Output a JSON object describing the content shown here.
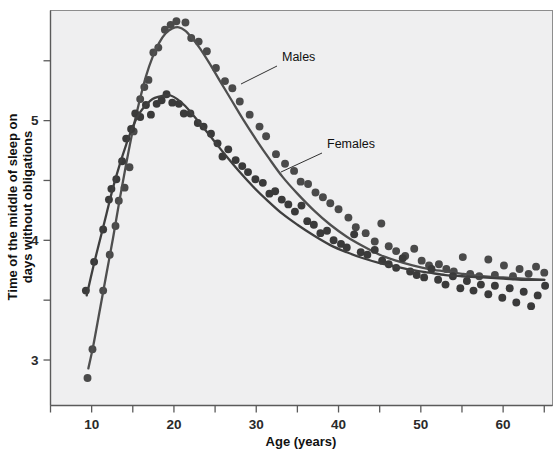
{
  "figure": {
    "background_color": "#ffffff",
    "plot_background_color": "#efeff0",
    "frame_color": "#8d8d8d"
  },
  "chart_data": {
    "type": "scatter",
    "title": "",
    "subtitle": "",
    "xlabel": "Age (years)",
    "ylabel": "Time of the middle of sleep on days without obligations",
    "ylabel_line1": "Time of the middle of sleep on",
    "ylabel_line2": "days without obligations",
    "xlim": [
      5,
      66
    ],
    "ylim": [
      2.62,
      5.92
    ],
    "grid": false,
    "legend_position": "inline-annotations",
    "x_major_ticks": [
      10,
      20,
      30,
      40,
      50,
      60
    ],
    "x_major_tick_labels": [
      "10",
      "20",
      "30",
      "40",
      "50",
      "60"
    ],
    "x_minor_ticks": [
      5,
      15,
      25,
      35,
      45,
      55,
      65
    ],
    "y_major_ticks": [
      3,
      4,
      5
    ],
    "y_major_tick_labels": [
      "3",
      "4",
      "5"
    ],
    "y_minor_ticks": [
      3.5,
      4.5,
      5.5
    ],
    "annotations": [
      {
        "text": "Males",
        "x_px": 282,
        "y_px": 61,
        "leader_from_px": [
          277,
          66
        ],
        "leader_to_px": [
          241,
          84
        ]
      },
      {
        "text": "Females",
        "x_px": 327,
        "y_px": 148,
        "leader_from_px": [
          322,
          153
        ],
        "leader_to_px": [
          281,
          172
        ]
      }
    ],
    "series": [
      {
        "name": "Males",
        "marker_color": "#4a4a4a",
        "line_color": "#4f4f4f",
        "marker_size_px": 5.1,
        "fit_curve": [
          [
            9.6,
            2.93
          ],
          [
            10.2,
            3.12
          ],
          [
            11.0,
            3.42
          ],
          [
            11.8,
            3.72
          ],
          [
            12.6,
            4.02
          ],
          [
            13.4,
            4.34
          ],
          [
            14.2,
            4.64
          ],
          [
            15.0,
            4.92
          ],
          [
            15.8,
            5.16
          ],
          [
            16.6,
            5.37
          ],
          [
            17.4,
            5.53
          ],
          [
            18.2,
            5.65
          ],
          [
            19.0,
            5.73
          ],
          [
            19.8,
            5.77
          ],
          [
            20.6,
            5.78
          ],
          [
            21.4,
            5.75
          ],
          [
            22.2,
            5.69
          ],
          [
            23.2,
            5.6
          ],
          [
            24.4,
            5.47
          ],
          [
            25.6,
            5.33
          ],
          [
            27.0,
            5.17
          ],
          [
            28.4,
            5.01
          ],
          [
            30.0,
            4.84
          ],
          [
            31.6,
            4.68
          ],
          [
            33.2,
            4.53
          ],
          [
            35.0,
            4.39
          ],
          [
            37.0,
            4.25
          ],
          [
            39.0,
            4.13
          ],
          [
            41.0,
            4.03
          ],
          [
            43.0,
            3.95
          ],
          [
            45.0,
            3.88
          ],
          [
            47.0,
            3.83
          ],
          [
            49.0,
            3.79
          ],
          [
            51.0,
            3.76
          ],
          [
            53.0,
            3.74
          ],
          [
            55.0,
            3.72
          ],
          [
            57.5,
            3.7
          ],
          [
            60.0,
            3.69
          ],
          [
            62.5,
            3.68
          ],
          [
            65.0,
            3.67
          ]
        ],
        "points": [
          [
            9.5,
            2.85
          ],
          [
            10.1,
            3.09
          ],
          [
            11.4,
            3.58
          ],
          [
            12.2,
            3.88
          ],
          [
            12.9,
            4.12
          ],
          [
            13.3,
            4.33
          ],
          [
            14.0,
            4.44
          ],
          [
            14.6,
            4.61
          ],
          [
            15.1,
            4.91
          ],
          [
            15.9,
            5.18
          ],
          [
            16.4,
            5.28
          ],
          [
            16.9,
            5.34
          ],
          [
            17.5,
            5.57
          ],
          [
            18.1,
            5.61
          ],
          [
            18.9,
            5.76
          ],
          [
            19.6,
            5.8
          ],
          [
            20.3,
            5.83
          ],
          [
            21.4,
            5.82
          ],
          [
            22.1,
            5.69
          ],
          [
            23.0,
            5.66
          ],
          [
            24.0,
            5.58
          ],
          [
            25.1,
            5.44
          ],
          [
            26.2,
            5.33
          ],
          [
            27.1,
            5.27
          ],
          [
            28.0,
            5.16
          ],
          [
            29.2,
            5.05
          ],
          [
            30.4,
            4.95
          ],
          [
            31.2,
            4.87
          ],
          [
            32.4,
            4.72
          ],
          [
            33.5,
            4.64
          ],
          [
            34.6,
            4.58
          ],
          [
            35.4,
            4.49
          ],
          [
            36.3,
            4.47
          ],
          [
            37.2,
            4.4
          ],
          [
            38.1,
            4.36
          ],
          [
            39.0,
            4.31
          ],
          [
            40.0,
            4.26
          ],
          [
            41.2,
            4.19
          ],
          [
            42.1,
            4.11
          ],
          [
            43.3,
            4.06
          ],
          [
            44.4,
            3.99
          ],
          [
            45.2,
            4.14
          ],
          [
            46.1,
            3.95
          ],
          [
            47.0,
            3.91
          ],
          [
            48.1,
            3.87
          ],
          [
            49.2,
            3.93
          ],
          [
            50.1,
            3.83
          ],
          [
            51.0,
            3.79
          ],
          [
            52.2,
            3.8
          ],
          [
            53.1,
            3.76
          ],
          [
            54.0,
            3.74
          ],
          [
            55.1,
            3.86
          ],
          [
            56.0,
            3.72
          ],
          [
            57.1,
            3.7
          ],
          [
            58.2,
            3.84
          ],
          [
            59.0,
            3.71
          ],
          [
            60.1,
            3.79
          ],
          [
            61.2,
            3.7
          ],
          [
            62.0,
            3.76
          ],
          [
            63.1,
            3.72
          ],
          [
            64.0,
            3.78
          ],
          [
            65.0,
            3.73
          ]
        ]
      },
      {
        "name": "Females",
        "marker_color": "#3a3a3a",
        "line_color": "#3f3f3f",
        "marker_size_px": 5.1,
        "fit_curve": [
          [
            9.4,
            3.54
          ],
          [
            10.2,
            3.78
          ],
          [
            11.0,
            4.0
          ],
          [
            11.8,
            4.22
          ],
          [
            12.6,
            4.44
          ],
          [
            13.4,
            4.63
          ],
          [
            14.2,
            4.8
          ],
          [
            15.0,
            4.95
          ],
          [
            15.8,
            5.06
          ],
          [
            16.6,
            5.13
          ],
          [
            17.4,
            5.18
          ],
          [
            18.2,
            5.2
          ],
          [
            19.0,
            5.21
          ],
          [
            19.6,
            5.21
          ],
          [
            20.4,
            5.18
          ],
          [
            21.4,
            5.12
          ],
          [
            22.4,
            5.04
          ],
          [
            23.6,
            4.94
          ],
          [
            25.0,
            4.82
          ],
          [
            26.4,
            4.7
          ],
          [
            28.0,
            4.57
          ],
          [
            29.6,
            4.45
          ],
          [
            31.4,
            4.33
          ],
          [
            33.2,
            4.22
          ],
          [
            35.0,
            4.13
          ],
          [
            37.0,
            4.04
          ],
          [
            39.0,
            3.96
          ],
          [
            41.0,
            3.9
          ],
          [
            43.0,
            3.85
          ],
          [
            45.0,
            3.81
          ],
          [
            47.0,
            3.78
          ],
          [
            49.0,
            3.75
          ],
          [
            51.0,
            3.73
          ],
          [
            53.0,
            3.71
          ],
          [
            55.0,
            3.7
          ],
          [
            57.5,
            3.69
          ],
          [
            60.0,
            3.68
          ],
          [
            62.5,
            3.67
          ],
          [
            65.0,
            3.67
          ]
        ],
        "points": [
          [
            9.3,
            3.58
          ],
          [
            10.3,
            3.82
          ],
          [
            11.4,
            4.09
          ],
          [
            12.1,
            4.34
          ],
          [
            12.4,
            4.43
          ],
          [
            13.0,
            4.51
          ],
          [
            13.7,
            4.66
          ],
          [
            14.2,
            4.85
          ],
          [
            14.8,
            4.93
          ],
          [
            15.3,
            5.06
          ],
          [
            15.9,
            5.03
          ],
          [
            16.6,
            5.13
          ],
          [
            17.2,
            5.05
          ],
          [
            17.9,
            5.14
          ],
          [
            18.5,
            5.17
          ],
          [
            19.1,
            5.22
          ],
          [
            19.8,
            5.15
          ],
          [
            20.6,
            5.14
          ],
          [
            21.2,
            5.06
          ],
          [
            22.0,
            5.06
          ],
          [
            22.9,
            4.98
          ],
          [
            23.6,
            4.95
          ],
          [
            24.5,
            4.89
          ],
          [
            25.3,
            4.81
          ],
          [
            25.9,
            4.7
          ],
          [
            26.6,
            4.76
          ],
          [
            27.5,
            4.67
          ],
          [
            28.3,
            4.62
          ],
          [
            29.0,
            4.57
          ],
          [
            29.9,
            4.51
          ],
          [
            30.8,
            4.48
          ],
          [
            31.6,
            4.39
          ],
          [
            32.3,
            4.41
          ],
          [
            33.1,
            4.34
          ],
          [
            33.9,
            4.3
          ],
          [
            34.7,
            4.24
          ],
          [
            35.5,
            4.29
          ],
          [
            36.2,
            4.16
          ],
          [
            37.0,
            4.13
          ],
          [
            37.8,
            4.06
          ],
          [
            38.6,
            4.08
          ],
          [
            39.4,
            4.0
          ],
          [
            40.3,
            3.97
          ],
          [
            41.0,
            3.94
          ],
          [
            41.9,
            4.05
          ],
          [
            42.7,
            3.9
          ],
          [
            43.5,
            3.88
          ],
          [
            44.4,
            3.92
          ],
          [
            45.3,
            3.83
          ],
          [
            46.1,
            3.8
          ],
          [
            47.0,
            3.77
          ],
          [
            47.8,
            3.85
          ],
          [
            48.7,
            3.74
          ],
          [
            49.5,
            3.71
          ],
          [
            50.4,
            3.69
          ],
          [
            51.3,
            3.76
          ],
          [
            52.1,
            3.67
          ],
          [
            53.0,
            3.63
          ],
          [
            53.9,
            3.7
          ],
          [
            54.8,
            3.6
          ],
          [
            55.6,
            3.66
          ],
          [
            56.4,
            3.58
          ],
          [
            57.3,
            3.63
          ],
          [
            58.2,
            3.55
          ],
          [
            59.0,
            3.62
          ],
          [
            59.9,
            3.52
          ],
          [
            60.8,
            3.6
          ],
          [
            61.6,
            3.48
          ],
          [
            62.5,
            3.57
          ],
          [
            63.4,
            3.45
          ],
          [
            64.2,
            3.54
          ],
          [
            65.1,
            3.62
          ]
        ]
      }
    ]
  }
}
